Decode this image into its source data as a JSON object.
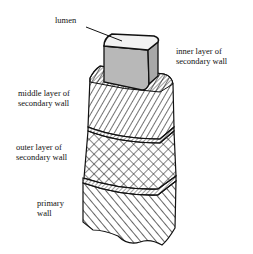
{
  "diagram": {
    "labels": {
      "lumen": "lumen",
      "inner_layer_line1": "inner layer of",
      "inner_layer_line2": "secondary wall",
      "middle_layer_line1": "middle layer of",
      "middle_layer_line2": "secondary wall",
      "outer_layer_line1": "outer layer of",
      "outer_layer_line2": "secondary wall",
      "primary_line1": "primary",
      "primary_line2": "wall"
    },
    "colors": {
      "ink": "#111111",
      "inner_fill": "#b8b8b8",
      "lumen_fill": "#f2f2f2",
      "background": "#ffffff"
    }
  }
}
